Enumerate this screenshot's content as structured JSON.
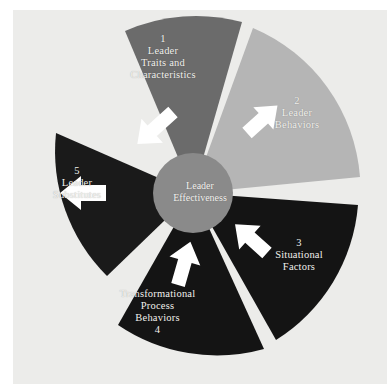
{
  "diagram": {
    "background_color": "#ececea",
    "page_color": "#ffffff",
    "center": {
      "label": "Leader\nEffectiveness",
      "color": "#8a8a8a",
      "text_color": "#f4f3f0"
    },
    "segments": [
      {
        "number": "1",
        "label": "1\nLeader\nTraits and\nCharacteristics",
        "text": "Leader Traits and Characteristics",
        "color": "#6b6b6b",
        "position": "top",
        "arrow": "arrow-down-right"
      },
      {
        "number": "2",
        "label": "2\nLeader\nBehaviors",
        "text": "Leader Behaviors",
        "color": "#b5b5b5",
        "position": "upper-right",
        "arrow": "arrow-down-left"
      },
      {
        "number": "3",
        "label": "3\nSituational\nFactors",
        "text": "Situational Factors",
        "color": "#141414",
        "position": "lower-right",
        "arrow": "arrow-up-left"
      },
      {
        "number": "4",
        "label": "Transformational\nProcess\nBehaviors\n4",
        "text": "Transformational Process Behaviors",
        "color": "#141414",
        "position": "bottom",
        "arrow": "arrow-up"
      },
      {
        "number": "5",
        "label": "5\nLeader\nSubstitutes",
        "text": "Leader Substitutes",
        "color": "#1a1a1a",
        "position": "left",
        "arrow": "arrow-right"
      }
    ],
    "arrow_color": "#ffffff"
  }
}
